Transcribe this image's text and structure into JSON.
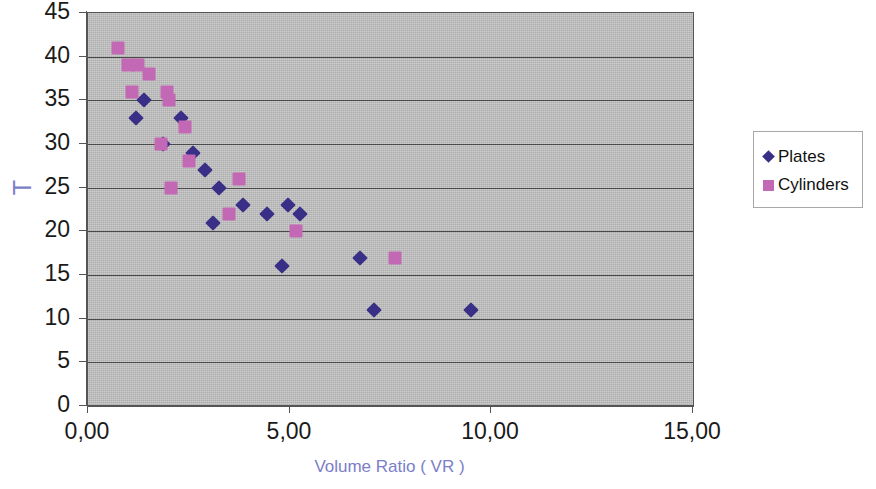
{
  "chart_data": {
    "type": "scatter",
    "title": "",
    "xlabel": "Volume Ratio ( VR )",
    "ylabel": "T",
    "xlim": [
      0,
      15
    ],
    "ylim": [
      0,
      45
    ],
    "x_ticks": [
      0,
      5,
      10,
      15
    ],
    "x_tick_labels": [
      "0,00",
      "5,00",
      "10,00",
      "15,00"
    ],
    "y_ticks": [
      0,
      5,
      10,
      15,
      20,
      25,
      30,
      35,
      40,
      45
    ],
    "y_tick_labels": [
      "0",
      "5",
      "10",
      "15",
      "20",
      "25",
      "30",
      "35",
      "40",
      "45"
    ],
    "grid": "horizontal",
    "plot_background": "#bfbfbf",
    "legend_position": "right",
    "series": [
      {
        "name": "Plates",
        "marker": "diamond",
        "color": "#3a2f86",
        "points": [
          [
            1.4,
            35
          ],
          [
            1.2,
            33
          ],
          [
            2.3,
            33
          ],
          [
            1.85,
            30
          ],
          [
            2.6,
            29
          ],
          [
            2.9,
            27
          ],
          [
            3.25,
            25
          ],
          [
            3.1,
            21
          ],
          [
            3.85,
            23
          ],
          [
            4.45,
            22
          ],
          [
            4.95,
            23
          ],
          [
            5.25,
            22
          ],
          [
            4.8,
            16
          ],
          [
            6.75,
            17
          ],
          [
            7.1,
            11
          ],
          [
            9.5,
            11
          ]
        ]
      },
      {
        "name": "Cylinders",
        "marker": "square",
        "color": "#c368b4",
        "points": [
          [
            0.75,
            41
          ],
          [
            1.0,
            39
          ],
          [
            1.25,
            39
          ],
          [
            1.5,
            38
          ],
          [
            1.1,
            36
          ],
          [
            1.95,
            36
          ],
          [
            2.0,
            35
          ],
          [
            2.4,
            32
          ],
          [
            1.8,
            30
          ],
          [
            2.5,
            28
          ],
          [
            2.05,
            25
          ],
          [
            3.75,
            26
          ],
          [
            3.5,
            22
          ],
          [
            5.15,
            20
          ],
          [
            7.6,
            17
          ]
        ]
      }
    ]
  },
  "legend": {
    "entries": [
      {
        "label": "Plates",
        "marker": "diamond",
        "color": "#3a2f86"
      },
      {
        "label": "Cylinders",
        "marker": "square",
        "color": "#c368b4"
      }
    ]
  },
  "axis_title_color": "#7b7ec9",
  "tick_label_color": "#1a1a1a"
}
